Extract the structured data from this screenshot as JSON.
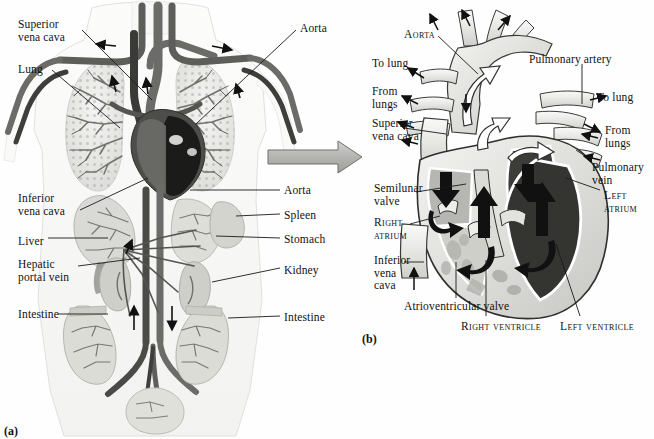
{
  "figure": {
    "panel_a_tag": "(a)",
    "panel_b_tag": "(b)"
  },
  "panel_a": {
    "name": "human-circulatory-system",
    "labels_left": [
      {
        "id": "superior-vena-cava",
        "text": "Superior\nvena cava",
        "x": 18,
        "y": 18
      },
      {
        "id": "lung",
        "text": "Lung",
        "x": 18,
        "y": 63
      },
      {
        "id": "inferior-vena-cava",
        "text": "Inferior\nvena cava",
        "x": 18,
        "y": 192
      },
      {
        "id": "liver",
        "text": "Liver",
        "x": 18,
        "y": 235
      },
      {
        "id": "hepatic-portal-vein",
        "text": "Hepatic\nportal vein",
        "x": 18,
        "y": 258
      },
      {
        "id": "intestine-left",
        "text": "Intestine",
        "x": 18,
        "y": 308
      }
    ],
    "labels_right": [
      {
        "id": "aorta-top",
        "text": "Aorta",
        "x": 300,
        "y": 22
      },
      {
        "id": "aorta-abdominal",
        "text": "Aorta",
        "x": 284,
        "y": 184
      },
      {
        "id": "spleen",
        "text": "Spleen",
        "x": 284,
        "y": 209
      },
      {
        "id": "stomach",
        "text": "Stomach",
        "x": 284,
        "y": 233
      },
      {
        "id": "kidney",
        "text": "Kidney",
        "x": 284,
        "y": 264
      },
      {
        "id": "intestine-right",
        "text": "Intestine",
        "x": 284,
        "y": 311
      }
    ]
  },
  "panel_b": {
    "name": "heart-cross-section",
    "labels": [
      {
        "id": "aorta",
        "text": "Aorta",
        "x": 404,
        "y": 28,
        "style": "small-caps",
        "align": "left"
      },
      {
        "id": "to-lung-left",
        "text": "To lung",
        "x": 372,
        "y": 57,
        "style": "normal",
        "align": "left"
      },
      {
        "id": "pulmonary-artery",
        "text": "Pulmonary artery",
        "x": 529,
        "y": 53,
        "style": "normal",
        "align": "left"
      },
      {
        "id": "from-lungs-left",
        "text": "From\nlungs",
        "x": 372,
        "y": 85,
        "style": "normal",
        "align": "left"
      },
      {
        "id": "to-lung-right",
        "text": "To lung",
        "x": 597,
        "y": 91,
        "style": "normal",
        "align": "left"
      },
      {
        "id": "superior-vena-cava",
        "text": "Superior\nvena cava",
        "x": 372,
        "y": 117,
        "style": "normal",
        "align": "left"
      },
      {
        "id": "from-lungs-right",
        "text": "From\nlungs",
        "x": 605,
        "y": 124,
        "style": "normal",
        "align": "left"
      },
      {
        "id": "pulmonary-vein",
        "text": "Pulmonary\nvein",
        "x": 592,
        "y": 161,
        "style": "normal",
        "align": "left"
      },
      {
        "id": "semilunar-valve",
        "text": "Semilunar\nvalve",
        "x": 374,
        "y": 182,
        "style": "normal",
        "align": "left"
      },
      {
        "id": "left-atrium",
        "text": "Left\natrium",
        "x": 604,
        "y": 189,
        "style": "small-caps",
        "align": "left"
      },
      {
        "id": "right-atrium",
        "text": "Right\natrium",
        "x": 374,
        "y": 216,
        "style": "small-caps",
        "align": "left"
      },
      {
        "id": "inferior-vena-cava",
        "text": "Inferior\nvena\ncava",
        "x": 374,
        "y": 254,
        "style": "normal",
        "align": "left"
      },
      {
        "id": "atrioventricular-valve",
        "text": "Atrioventricular valve",
        "x": 404,
        "y": 300,
        "style": "normal",
        "align": "left"
      },
      {
        "id": "right-ventricle",
        "text": "Right ventricle",
        "x": 461,
        "y": 320,
        "style": "small-caps",
        "align": "left"
      },
      {
        "id": "left-ventricle",
        "text": "Left ventricle",
        "x": 560,
        "y": 320,
        "style": "small-caps",
        "align": "left"
      }
    ]
  },
  "colors": {
    "ink": "#111111",
    "artery_dark": "#4a4a4a",
    "vein_mid": "#6e6e6e",
    "chamber_dark": "#3a3a3a",
    "chamber_light": "#c9c9c6",
    "tissue": "#e4e4e1",
    "paper": "#ffffff",
    "transfer_arrow": "#b9b9b6"
  }
}
